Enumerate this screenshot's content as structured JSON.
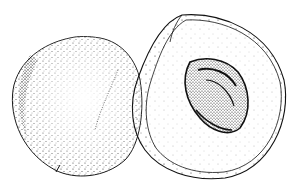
{
  "image": {
    "subject": "Peach illustration",
    "style": "stippled pen-and-ink drawing",
    "elements": [
      {
        "name": "whole-peach",
        "description": "Whole peach on the left, heavily stippled with a crease"
      },
      {
        "name": "halved-peach",
        "description": "Peach cut in half on the right showing flesh and pit"
      },
      {
        "name": "peach-pit",
        "description": "Textured stone inside the halved peach"
      }
    ],
    "colors": {
      "ink": "#111111",
      "paper": "#ffffff"
    }
  }
}
